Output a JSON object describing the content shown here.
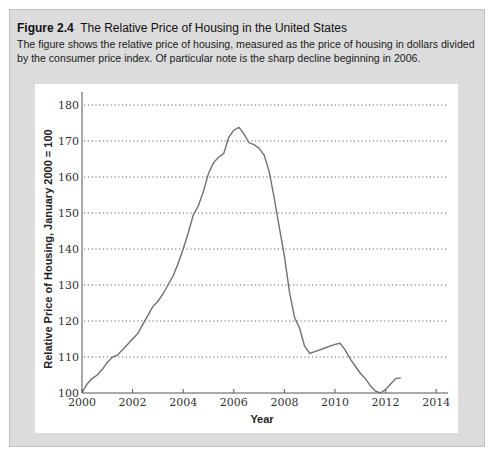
{
  "figure": {
    "number": "Figure 2.4",
    "title": "The Relative Price of Housing in the United States",
    "caption": "The figure shows the relative price of housing, measured as the price of housing in dollars divided by the consumer price index. Of particular note is the sharp decline beginning in 2006."
  },
  "chart_data": {
    "type": "line",
    "title": "The Relative Price of Housing in the United States",
    "xlabel": "Year",
    "ylabel": "Relative Price of Housing, January 2000 = 100",
    "xlim": [
      2000,
      2014.5
    ],
    "ylim": [
      100,
      183
    ],
    "x_ticks": [
      2000,
      2002,
      2004,
      2006,
      2008,
      2010,
      2012,
      2014
    ],
    "y_ticks": [
      100,
      110,
      120,
      130,
      140,
      150,
      160,
      170,
      180
    ],
    "grid": "horizontal dotted",
    "legend": "none",
    "series": [
      {
        "name": "Relative Price of Housing",
        "x": [
          2000.0,
          2000.2,
          2000.4,
          2000.6,
          2000.8,
          2001.0,
          2001.2,
          2001.4,
          2001.6,
          2001.8,
          2002.0,
          2002.2,
          2002.4,
          2002.6,
          2002.8,
          2003.0,
          2003.2,
          2003.4,
          2003.6,
          2003.8,
          2004.0,
          2004.2,
          2004.4,
          2004.6,
          2004.8,
          2005.0,
          2005.2,
          2005.4,
          2005.6,
          2005.8,
          2006.0,
          2006.2,
          2006.4,
          2006.6,
          2006.8,
          2007.0,
          2007.2,
          2007.4,
          2007.6,
          2007.8,
          2008.0,
          2008.2,
          2008.4,
          2008.6,
          2008.8,
          2009.0,
          2009.2,
          2009.4,
          2009.6,
          2009.8,
          2010.0,
          2010.2,
          2010.4,
          2010.6,
          2010.8,
          2011.0,
          2011.2,
          2011.4,
          2011.6,
          2011.8,
          2012.0,
          2012.2,
          2012.4,
          2012.6
        ],
        "values": [
          100.0,
          102.5,
          104.0,
          105.0,
          106.5,
          108.5,
          110.0,
          110.5,
          112.0,
          113.5,
          115.0,
          116.5,
          119.0,
          121.5,
          124.0,
          125.5,
          127.5,
          130.0,
          132.5,
          136.0,
          140.0,
          144.5,
          149.5,
          152.0,
          156.0,
          161.0,
          164.0,
          165.5,
          166.5,
          171.0,
          173.0,
          173.8,
          172.0,
          169.5,
          169.0,
          168.0,
          166.0,
          161.5,
          154.0,
          146.0,
          138.0,
          128.0,
          121.0,
          118.0,
          113.0,
          111.0,
          111.5,
          112.0,
          112.5,
          113.0,
          113.5,
          113.8,
          112.0,
          109.5,
          107.5,
          105.5,
          104.0,
          102.0,
          100.5,
          100.0,
          101.0,
          102.5,
          104.0,
          104.2
        ]
      }
    ],
    "annotations": []
  }
}
